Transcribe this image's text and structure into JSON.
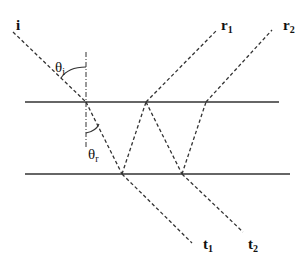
{
  "colors": {
    "line": "#333333",
    "ray": "#333333",
    "text": "#111111"
  },
  "labels": {
    "incident": "i",
    "r1_main": "r",
    "r1_sub": "1",
    "r2_main": "r",
    "r2_sub": "2",
    "t1_main": "t",
    "t1_sub": "1",
    "t2_main": "t",
    "t2_sub": "2",
    "theta_i_main": "θ",
    "theta_i_sub": "i",
    "theta_r_main": "θ",
    "theta_r_sub": "r"
  },
  "geometry": {
    "top_surface": {
      "x1": 25,
      "y1": 102,
      "x2": 279,
      "y2": 102
    },
    "bottom_surface": {
      "x1": 25,
      "y1": 174,
      "x2": 290,
      "y2": 174
    },
    "normal": {
      "x1": 86,
      "y1": 52,
      "x2": 86,
      "y2": 148
    },
    "rays": [
      {
        "name": "incident-ray",
        "x1": 13,
        "y1": 32,
        "x2": 86,
        "y2": 102
      },
      {
        "name": "refracted-ray-1",
        "x1": 86,
        "y1": 102,
        "x2": 122,
        "y2": 174
      },
      {
        "name": "internal-reflected-1",
        "x1": 122,
        "y1": 174,
        "x2": 146,
        "y2": 102
      },
      {
        "name": "reflected-ray-r1",
        "x1": 146,
        "y1": 102,
        "x2": 217,
        "y2": 30
      },
      {
        "name": "internal-reflected-2",
        "x1": 146,
        "y1": 102,
        "x2": 182,
        "y2": 174
      },
      {
        "name": "internal-reflected-3",
        "x1": 182,
        "y1": 174,
        "x2": 206,
        "y2": 102
      },
      {
        "name": "reflected-ray-r2",
        "x1": 206,
        "y1": 102,
        "x2": 272,
        "y2": 30
      },
      {
        "name": "transmitted-ray-t1",
        "x1": 122,
        "y1": 174,
        "x2": 192,
        "y2": 243
      },
      {
        "name": "transmitted-ray-t2",
        "x1": 182,
        "y1": 174,
        "x2": 243,
        "y2": 232
      }
    ]
  }
}
